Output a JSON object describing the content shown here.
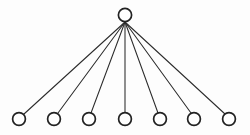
{
  "diagram": {
    "type": "star-tree",
    "canvas": {
      "width": 250,
      "height": 135,
      "background": "#fdfdfd"
    },
    "style": {
      "node_fill": "#ffffff",
      "node_stroke": "#222222",
      "node_stroke_width": 1.7,
      "node_radius": 6.4,
      "edge_stroke": "#2b2b2b",
      "edge_stroke_width": 1.05
    },
    "edge_origin": {
      "x": 125,
      "y": 22
    },
    "nodes": [
      {
        "id": "root",
        "role": "root",
        "cx": 125,
        "cy": 15,
        "r": 6.6,
        "label": ""
      },
      {
        "id": "leaf-1",
        "role": "leaf",
        "cx": 19,
        "cy": 119,
        "r": 6.4,
        "label": ""
      },
      {
        "id": "leaf-2",
        "role": "leaf",
        "cx": 54,
        "cy": 119,
        "r": 6.4,
        "label": ""
      },
      {
        "id": "leaf-3",
        "role": "leaf",
        "cx": 89,
        "cy": 119,
        "r": 6.4,
        "label": ""
      },
      {
        "id": "leaf-4",
        "role": "leaf",
        "cx": 125,
        "cy": 119,
        "r": 6.4,
        "label": ""
      },
      {
        "id": "leaf-5",
        "role": "leaf",
        "cx": 160,
        "cy": 119,
        "r": 6.4,
        "label": ""
      },
      {
        "id": "leaf-6",
        "role": "leaf",
        "cx": 194,
        "cy": 119,
        "r": 6.4,
        "label": ""
      },
      {
        "id": "leaf-7",
        "role": "leaf",
        "cx": 229,
        "cy": 119,
        "r": 6.4,
        "label": ""
      }
    ],
    "edges": [
      {
        "id": "edge-root-leaf-1",
        "from": "root",
        "to": "leaf-1",
        "x1": 125,
        "y1": 22,
        "x2": 24,
        "y2": 114
      },
      {
        "id": "edge-root-leaf-2",
        "from": "root",
        "to": "leaf-2",
        "x1": 125,
        "y1": 22,
        "x2": 58,
        "y2": 113
      },
      {
        "id": "edge-root-leaf-3",
        "from": "root",
        "to": "leaf-3",
        "x1": 125,
        "y1": 22,
        "x2": 91,
        "y2": 113
      },
      {
        "id": "edge-root-leaf-4",
        "from": "root",
        "to": "leaf-4",
        "x1": 125,
        "y1": 22,
        "x2": 125,
        "y2": 113
      },
      {
        "id": "edge-root-leaf-5",
        "from": "root",
        "to": "leaf-5",
        "x1": 125,
        "y1": 22,
        "x2": 158,
        "y2": 113
      },
      {
        "id": "edge-root-leaf-6",
        "from": "root",
        "to": "leaf-6",
        "x1": 125,
        "y1": 22,
        "x2": 191,
        "y2": 113
      },
      {
        "id": "edge-root-leaf-7",
        "from": "root",
        "to": "leaf-7",
        "x1": 125,
        "y1": 22,
        "x2": 225,
        "y2": 114
      }
    ],
    "counts": {
      "nodes": 8,
      "edges": 7,
      "leaves": 7,
      "root_degree": 7
    }
  }
}
